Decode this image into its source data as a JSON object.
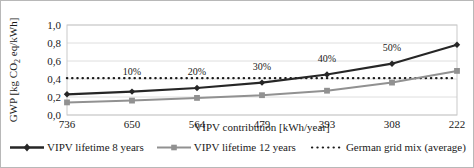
{
  "chart_data": {
    "type": "line",
    "title": "",
    "xlabel": "VIPV contribution [kWh/year]",
    "ylabel": "GWP [kg CO2 eq/kWh]",
    "ylabel_parts": {
      "pre": "GWP [kg CO",
      "sub": "2",
      "post": " eq/kWh]"
    },
    "categories": [
      "736",
      "650",
      "564",
      "479",
      "393",
      "308",
      "222"
    ],
    "ylim": [
      0.0,
      1.0
    ],
    "ytick_values": [
      0.0,
      0.2,
      0.4,
      0.6,
      0.8,
      1.0
    ],
    "ytick_labels": [
      "0,0",
      "0,2",
      "0,4",
      "0,6",
      "0,8",
      "1,0"
    ],
    "grid": true,
    "legend_position": "bottom",
    "series": [
      {
        "name": "VIPV lifetime 8 years",
        "values": [
          0.23,
          0.26,
          0.3,
          0.36,
          0.45,
          0.57,
          0.78
        ],
        "color": "#262626",
        "marker": "diamond"
      },
      {
        "name": "VIPV lifetime 12 years",
        "values": [
          0.14,
          0.16,
          0.19,
          0.22,
          0.27,
          0.36,
          0.49
        ],
        "color": "#919191",
        "marker": "square"
      },
      {
        "name": "German grid mix (average)",
        "values": [
          0.41,
          0.41,
          0.41,
          0.41,
          0.41,
          0.41,
          0.41
        ],
        "color": "#1a1a1a",
        "marker": "none",
        "style": "dotted"
      }
    ],
    "annotations": [
      {
        "text": "10%",
        "category_index": 1,
        "value": 0.41
      },
      {
        "text": "20%",
        "category_index": 2,
        "value": 0.41
      },
      {
        "text": "30%",
        "category_index": 3,
        "value": 0.47
      },
      {
        "text": "40%",
        "category_index": 4,
        "value": 0.56
      },
      {
        "text": "50%",
        "category_index": 5,
        "value": 0.68
      }
    ]
  },
  "legend": {
    "items": [
      {
        "label": "VIPV lifetime 8 years"
      },
      {
        "label": "VIPV lifetime 12 years"
      },
      {
        "label": "German grid mix (average)"
      }
    ]
  }
}
